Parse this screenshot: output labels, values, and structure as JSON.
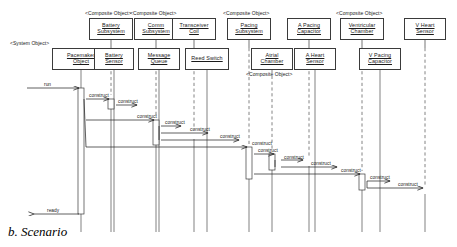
{
  "figure": {
    "caption": "b. Scenario"
  },
  "stereotypes": {
    "system_object": "<System Object>",
    "composite_object": "<Composite Object>"
  },
  "lifelines": [
    {
      "id": "pacemaker",
      "name": "Pacemaker\nObject",
      "line1": "Pacemaker",
      "line2": "Object",
      "stereotype": "<System Object>",
      "row": 2,
      "x": 52,
      "width": 58,
      "cx": 81
    },
    {
      "id": "battery_sub",
      "name": "Battery Subsystem",
      "line1": "Battery",
      "line2": "Subsystem",
      "stereotype": "<Composite Object>",
      "row": 1,
      "x": 89,
      "width": 44,
      "cx": 111
    },
    {
      "id": "battery_sen",
      "name": "Battery Sensor",
      "line1": "Battery",
      "line2": "Sensor",
      "stereotype": "",
      "row": 2,
      "x": 94,
      "width": 40,
      "cx": 114
    },
    {
      "id": "comm_sub",
      "name": "Comm Subsystem",
      "line1": "Comm",
      "line2": "Subsystem",
      "stereotype": "<Composite Object>",
      "row": 1,
      "x": 134,
      "width": 44,
      "cx": 156
    },
    {
      "id": "msg_queue",
      "name": "Message Queue",
      "line1": "Message",
      "line2": "Queue",
      "stereotype": "",
      "row": 2,
      "x": 138,
      "width": 42,
      "cx": 159
    },
    {
      "id": "transceiver",
      "name": "Transceiver Coil",
      "line1": "Transceiver",
      "line2": "Coil",
      "stereotype": "",
      "row": 1,
      "x": 172,
      "width": 44,
      "cx": 194
    },
    {
      "id": "reed_switch",
      "name": "Reed Switch",
      "line1": "Reed Switch",
      "line2": "",
      "stereotype": "",
      "row": 2,
      "x": 185,
      "width": 44,
      "cx": 207
    },
    {
      "id": "pacing_sub",
      "name": "Pacing Subsystem",
      "line1": "Pacing",
      "line2": "Subsystem",
      "stereotype": "<Composite Object>",
      "row": 1,
      "x": 227,
      "width": 44,
      "cx": 249
    },
    {
      "id": "atrial_ch",
      "name": "Atrial Chamber",
      "line1": "Atrial",
      "line2": "Chamber",
      "stereotype": "<Composite Object>",
      "row": 2,
      "x": 251,
      "width": 42,
      "cx": 272
    },
    {
      "id": "a_pacing_cap",
      "name": "A Pacing Capacitor",
      "line1": "A Pacing",
      "line2": "Capacitor",
      "stereotype": "",
      "row": 1,
      "x": 287,
      "width": 44,
      "cx": 309
    },
    {
      "id": "a_heart_sen",
      "name": "A Heart Sensor",
      "line1": "A Heart",
      "line2": "Sensor",
      "stereotype": "",
      "row": 2,
      "x": 294,
      "width": 42,
      "cx": 315
    },
    {
      "id": "vent_ch",
      "name": "Ventricular Chamber",
      "line1": "Ventricular",
      "line2": "Chamber",
      "stereotype": "<Composite Object>",
      "row": 1,
      "x": 340,
      "width": 44,
      "cx": 362
    },
    {
      "id": "v_pacing_cap",
      "name": "V Pacing Capacitor",
      "line1": "V Pacing",
      "line2": "Capacitor",
      "stereotype": "",
      "row": 2,
      "x": 359,
      "width": 42,
      "cx": 380
    },
    {
      "id": "v_heart_sen",
      "name": "V Heart Sensor",
      "line1": "V Heart",
      "line2": "Sensor",
      "stereotype": "",
      "row": 1,
      "x": 404,
      "width": 42,
      "cx": 425
    }
  ],
  "messages": [
    {
      "id": "m0",
      "label": "run",
      "from": "external",
      "to": "pacemaker",
      "x1": 27,
      "x2": 79,
      "y": 88,
      "lx": 44,
      "ly": 82
    },
    {
      "id": "m1",
      "label": "construct",
      "from": "pacemaker",
      "to": "battery_sub",
      "x1": 86,
      "x2": 109,
      "y": 99,
      "lx": 89,
      "ly": 93
    },
    {
      "id": "m2",
      "label": "construct",
      "from": "battery_sub",
      "to": "battery_sen",
      "x1": 116,
      "x2": 137,
      "y": 105,
      "lx": 118,
      "ly": 99
    },
    {
      "id": "m3",
      "label": "construct",
      "from": "pacemaker",
      "to": "comm_sub",
      "x1": 86,
      "x2": 154,
      "y": 120,
      "lx": 137,
      "ly": 114
    },
    {
      "id": "m4",
      "label": "construct",
      "from": "comm_sub",
      "to": "msg_queue",
      "x1": 161,
      "x2": 181,
      "y": 126,
      "lx": 165,
      "ly": 120
    },
    {
      "id": "m5",
      "label": "construct",
      "from": "comm_sub",
      "to": "transceiver",
      "x1": 161,
      "x2": 208,
      "y": 133,
      "lx": 190,
      "ly": 127
    },
    {
      "id": "m6",
      "label": "construct",
      "from": "comm_sub",
      "to": "reed_switch",
      "x1": 161,
      "x2": 239,
      "y": 140,
      "lx": 220,
      "ly": 134
    },
    {
      "id": "m7",
      "label": "construct",
      "from": "pacemaker",
      "to": "pacing_sub",
      "x1": 86,
      "x2": 247,
      "y": 147,
      "lx": 252,
      "ly": 141
    },
    {
      "id": "m8",
      "label": "construct",
      "from": "pacing_sub",
      "to": "atrial_ch",
      "x1": 254,
      "x2": 274,
      "y": 154,
      "lx": 258,
      "ly": 148
    },
    {
      "id": "m9",
      "label": "construct",
      "from": "atrial_ch",
      "to": "a_pacing_cap",
      "x1": 281,
      "x2": 303,
      "y": 160,
      "lx": 284,
      "ly": 155
    },
    {
      "id": "m10",
      "label": "construct",
      "from": "atrial_ch",
      "to": "a_heart_sen",
      "x1": 281,
      "x2": 337,
      "y": 167,
      "lx": 311,
      "ly": 161
    },
    {
      "id": "m11",
      "label": "construct",
      "from": "pacing_sub",
      "to": "vent_ch",
      "x1": 254,
      "x2": 360,
      "y": 174,
      "lx": 341,
      "ly": 168
    },
    {
      "id": "m12",
      "label": "construct",
      "from": "vent_ch",
      "to": "v_pacing_cap",
      "x1": 367,
      "x2": 390,
      "y": 181,
      "lx": 370,
      "ly": 175
    },
    {
      "id": "m13",
      "label": "construct",
      "from": "vent_ch",
      "to": "v_heart_sen",
      "x1": 367,
      "x2": 423,
      "y": 188,
      "lx": 398,
      "ly": 182
    },
    {
      "id": "m14",
      "label": "ready",
      "from": "pacemaker",
      "to": "external",
      "x1": 79,
      "x2": 34,
      "y": 214,
      "lx": 47,
      "ly": 208
    }
  ]
}
